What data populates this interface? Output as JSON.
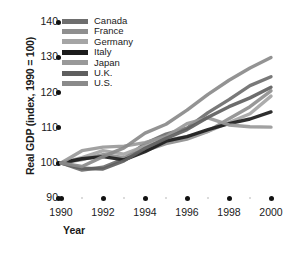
{
  "chart_data": {
    "type": "line",
    "title": "",
    "xlabel": "Year",
    "ylabel": "Real GDP (index, 1990 = 100)",
    "x": [
      1990,
      1991,
      1992,
      1993,
      1994,
      1995,
      1996,
      1997,
      1998,
      1999,
      2000
    ],
    "xlim": [
      1990,
      2000
    ],
    "ylim": [
      90,
      140
    ],
    "yticks": [
      90,
      100,
      110,
      120,
      130,
      140
    ],
    "xticks": [
      1990,
      1992,
      1994,
      1996,
      1998,
      2000
    ],
    "xticks_minor": [
      1991,
      1993,
      1995,
      1997,
      1999
    ],
    "grid": false,
    "legend_position": "top-left",
    "series": [
      {
        "name": "Canada",
        "color": "#6e6e6e",
        "values": [
          100,
          98.0,
          98.8,
          101.2,
          105.5,
          108.2,
          109.9,
          114.3,
          118.0,
          122.0,
          124.5
        ]
      },
      {
        "name": "France",
        "color": "#8f8f8f",
        "values": [
          100,
          101.0,
          102.4,
          101.5,
          103.5,
          105.5,
          106.8,
          109.0,
          112.6,
          116.0,
          120.5
        ]
      },
      {
        "name": "Germany",
        "color": "#a5a5a5",
        "values": [
          100,
          101.5,
          103.5,
          102.5,
          104.8,
          106.5,
          107.5,
          109.0,
          111.5,
          114.0,
          119.0
        ]
      },
      {
        "name": "Italy",
        "color": "#1c1c1c",
        "values": [
          100,
          101.2,
          101.8,
          100.9,
          103.2,
          106.2,
          107.5,
          109.5,
          111.2,
          112.5,
          114.5
        ]
      },
      {
        "name": "Japan",
        "color": "#999999",
        "values": [
          100,
          103.5,
          104.5,
          104.8,
          105.8,
          107.5,
          111.2,
          112.8,
          110.8,
          110.3,
          110.2
        ]
      },
      {
        "name": "U.K.",
        "color": "#5f5f5f",
        "values": [
          100,
          98.5,
          98.3,
          100.6,
          104.2,
          107.0,
          109.5,
          113.0,
          116.0,
          118.5,
          121.5
        ]
      },
      {
        "name": "U.S.",
        "color": "#8a8a8a",
        "values": [
          100,
          99.0,
          101.8,
          104.3,
          108.5,
          111.0,
          115.0,
          119.5,
          123.5,
          127.0,
          130.0
        ]
      }
    ]
  },
  "axes": {
    "y_title": "Real GDP (index, 1990 = 100)",
    "x_title": "Year",
    "y_tick_labels": [
      "140",
      "130",
      "120",
      "110",
      "100",
      "90"
    ],
    "x_tick_labels": [
      "1990",
      "1992",
      "1994",
      "1996",
      "1998",
      "2000"
    ]
  },
  "legend": {
    "items": [
      {
        "label": "Canada"
      },
      {
        "label": "France"
      },
      {
        "label": "Germany"
      },
      {
        "label": "Italy"
      },
      {
        "label": "Japan"
      },
      {
        "label": "U.K."
      },
      {
        "label": "U.S."
      }
    ]
  }
}
